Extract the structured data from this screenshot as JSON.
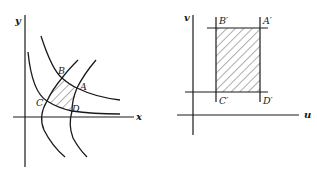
{
  "left_panel": {
    "axis_x_label": "x",
    "axis_y_label": "y",
    "points": {
      "A": "A",
      "B": "B",
      "C": "C",
      "D": "D"
    }
  },
  "right_panel": {
    "axis_u_label": "u",
    "axis_v_label": "v",
    "points": {
      "A": "A′",
      "B": "B′",
      "C": "C′",
      "D": "D′"
    }
  },
  "colors": {
    "ink": "#1a1a1a",
    "background": "#ffffff"
  }
}
